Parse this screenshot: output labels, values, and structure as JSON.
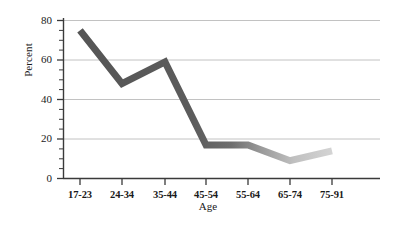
{
  "chart_data": {
    "type": "line",
    "title": "",
    "xlabel": "Age",
    "ylabel": "Percent",
    "categories": [
      "17-23",
      "24-34",
      "35-44",
      "45-54",
      "55-64",
      "65-74",
      "75-91"
    ],
    "values": [
      75,
      48,
      59,
      17,
      17,
      9,
      14
    ],
    "series": [
      {
        "name": "Percent",
        "values": [
          75,
          48,
          59,
          17,
          17,
          9,
          14
        ]
      }
    ],
    "ylim": [
      0,
      80
    ],
    "yticks": [
      0,
      20,
      40,
      60,
      80
    ],
    "ytick_labels": [
      "0",
      "20",
      "40",
      "60",
      "80"
    ],
    "yminor_ticks": [
      5,
      10,
      15,
      25,
      30,
      35,
      45,
      50,
      55,
      65,
      70,
      75
    ],
    "grid": "horizontal",
    "legend": "none",
    "line_color_start": "#585858",
    "line_color_end": "#c9c9c9",
    "grid_color": "#c2c2c2",
    "axis_color": "#3a3a3a",
    "background": "#ffffff"
  },
  "axis": {
    "y_title": "Percent",
    "x_title": "Age"
  }
}
